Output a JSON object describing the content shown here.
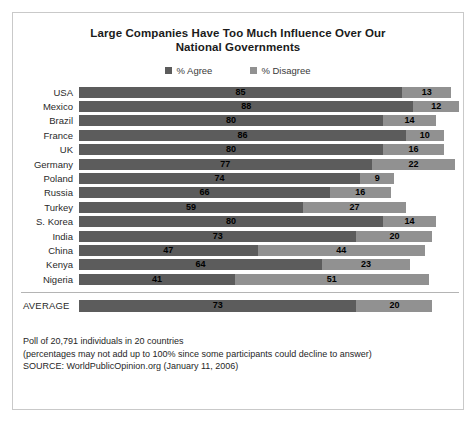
{
  "chart_data": {
    "type": "bar",
    "subtype": "stacked-horizontal",
    "title": "Large Companies Have Too Much Influence Over Our National Governments",
    "title_lines": [
      "Large Companies Have Too Much Influence Over Our",
      "National Governments"
    ],
    "xlabel": "",
    "ylabel": "",
    "xlim": [
      0,
      100
    ],
    "grid": false,
    "legend_position": "top-center",
    "colors": {
      "agree": "#5c5c5c",
      "disagree": "#919191",
      "frame": "#c9c9c9",
      "separator": "#b4b4b4",
      "text": "#2a2a2a"
    },
    "legend": [
      {
        "label": "% Agree",
        "color": "#5c5c5c"
      },
      {
        "label": "% Disagree",
        "color": "#919191"
      }
    ],
    "categories": [
      "USA",
      "Mexico",
      "Brazil",
      "France",
      "UK",
      "Germany",
      "Poland",
      "Russia",
      "Turkey",
      "S. Korea",
      "India",
      "China",
      "Kenya",
      "Nigeria"
    ],
    "series": [
      {
        "name": "% Agree",
        "color": "#5c5c5c",
        "values": [
          85,
          88,
          80,
          86,
          80,
          77,
          74,
          66,
          59,
          80,
          73,
          47,
          64,
          41
        ]
      },
      {
        "name": "% Disagree",
        "color": "#919191",
        "values": [
          13,
          12,
          14,
          10,
          16,
          22,
          9,
          16,
          27,
          14,
          20,
          44,
          23,
          51
        ]
      }
    ],
    "rows": [
      {
        "label": "USA",
        "agree": 85,
        "disagree": 13
      },
      {
        "label": "Mexico",
        "agree": 88,
        "disagree": 12
      },
      {
        "label": "Brazil",
        "agree": 80,
        "disagree": 14
      },
      {
        "label": "France",
        "agree": 86,
        "disagree": 10
      },
      {
        "label": "UK",
        "agree": 80,
        "disagree": 16
      },
      {
        "label": "Germany",
        "agree": 77,
        "disagree": 22
      },
      {
        "label": "Poland",
        "agree": 74,
        "disagree": 9
      },
      {
        "label": "Russia",
        "agree": 66,
        "disagree": 16
      },
      {
        "label": "Turkey",
        "agree": 59,
        "disagree": 27
      },
      {
        "label": "S. Korea",
        "agree": 80,
        "disagree": 14
      },
      {
        "label": "India",
        "agree": 73,
        "disagree": 20
      },
      {
        "label": "China",
        "agree": 47,
        "disagree": 44
      },
      {
        "label": "Kenya",
        "agree": 64,
        "disagree": 23
      },
      {
        "label": "Nigeria",
        "agree": 41,
        "disagree": 51
      }
    ],
    "average": {
      "label": "AVERAGE",
      "agree": 73,
      "disagree": 20
    },
    "annotations": [
      "Poll of 20,791 individuals in 20 countries",
      "(percentages may not add up to 100% since some participants could decline to answer)",
      "SOURCE: WorldPublicOpinion.org (January 11, 2006)"
    ]
  }
}
